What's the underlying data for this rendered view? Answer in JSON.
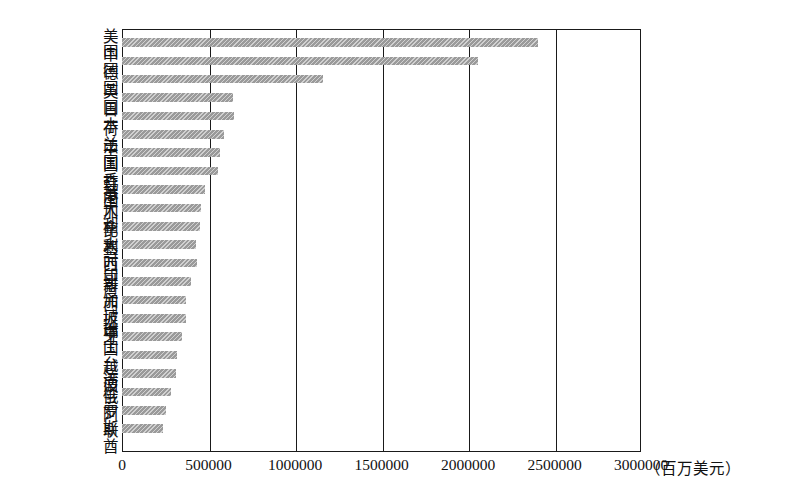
{
  "chart_data": {
    "type": "bar",
    "orientation": "horizontal",
    "title": "",
    "subtitle": "",
    "xlabel": "（百万美元）",
    "ylabel": "",
    "xlim": [
      0,
      3000000
    ],
    "ylim": null,
    "grid": true,
    "legend": null,
    "legend_position": "none",
    "bar_color": "#9a9a9a",
    "axis_color": "#1a1a1a",
    "x_ticks": [
      0,
      500000,
      1000000,
      1500000,
      2000000,
      2500000,
      3000000
    ],
    "x_tick_labels": [
      "0",
      "500000",
      "1000000",
      "1500000",
      "2000000",
      "2500000",
      "3000000"
    ],
    "unit_label": "（百万美元）",
    "categories": [
      "美国",
      "中国",
      "德国",
      "英国",
      "日本",
      "荷兰",
      "法国",
      "中国香港",
      "韩国",
      "意大利",
      "加拿大",
      "比利时",
      "墨西哥",
      "印度",
      "新加坡",
      "西班牙",
      "瑞士",
      "中国台湾",
      "越南",
      "波兰",
      "俄罗斯",
      "阿联酋"
    ],
    "values": [
      2405000,
      2060000,
      1160000,
      640000,
      645000,
      590000,
      565000,
      555000,
      480000,
      455000,
      450000,
      425000,
      435000,
      400000,
      370000,
      370000,
      345000,
      320000,
      310000,
      285000,
      255000,
      235000
    ],
    "annotations": []
  }
}
